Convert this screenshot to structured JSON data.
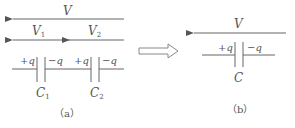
{
  "diagram": {
    "panel_a": {
      "caption": "（a）",
      "voltage_total": {
        "symbol": "V",
        "direction": "right-to-left"
      },
      "voltage_parts": [
        {
          "symbol": "V",
          "subscript": "1"
        },
        {
          "symbol": "V",
          "subscript": "2"
        }
      ],
      "capacitors": [
        {
          "symbol": "C",
          "subscript": "1",
          "left_charge": "+q",
          "right_charge": "−q"
        },
        {
          "symbol": "C",
          "subscript": "2",
          "left_charge": "+q",
          "right_charge": "−q"
        }
      ]
    },
    "transform_arrow": "hollow-right-arrow",
    "panel_b": {
      "caption": "（b）",
      "voltage_total": {
        "symbol": "V",
        "direction": "right-to-left"
      },
      "capacitor": {
        "symbol": "C",
        "left_charge": "+q",
        "right_charge": "−q"
      }
    },
    "colors": {
      "stroke": "#666666",
      "text": "#555555",
      "background": "#ffffff"
    }
  }
}
